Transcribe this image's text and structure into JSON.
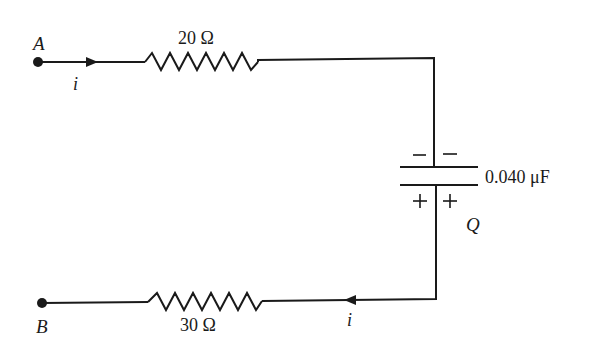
{
  "diagram": {
    "type": "circuit",
    "terminals": {
      "a": {
        "label": "A"
      },
      "b": {
        "label": "B"
      }
    },
    "resistors": [
      {
        "id": "r1",
        "label": "20 Ω",
        "value_ohms": 20
      },
      {
        "id": "r2",
        "label": "30 Ω",
        "value_ohms": 30
      }
    ],
    "capacitor": {
      "label": "0.040 μF",
      "value_uF": 0.04,
      "charge_label": "Q",
      "top_plate_signs": "−  −",
      "bottom_plate_signs": "+  +"
    },
    "current": {
      "top_label": "i",
      "bottom_label": "i"
    },
    "colors": {
      "line": "#1a1a1a",
      "background": "#ffffff"
    }
  }
}
